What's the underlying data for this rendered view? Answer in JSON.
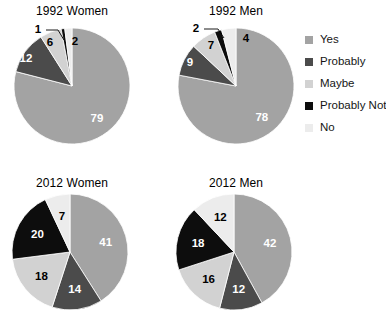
{
  "legend": {
    "position": "right",
    "items": [
      {
        "label": "Yes",
        "color": "#a3a3a3"
      },
      {
        "label": "Probably",
        "color": "#4b4b4b"
      },
      {
        "label": "Maybe",
        "color": "#d2d2d2"
      },
      {
        "label": "Probably Not",
        "color": "#0d0d0d"
      },
      {
        "label": "No",
        "color": "#ececec"
      }
    ]
  },
  "chart_data": [
    {
      "type": "pie",
      "title": "1992 Women",
      "categories": [
        "Yes",
        "Probably",
        "Maybe",
        "Probably Not",
        "No"
      ],
      "values": [
        79,
        12,
        6,
        1,
        2
      ],
      "colors": [
        "#a3a3a3",
        "#4b4b4b",
        "#d2d2d2",
        "#0d0d0d",
        "#ececec"
      ],
      "labels": [
        "79",
        "12",
        "6",
        "1",
        "2"
      ],
      "start_angle": 0,
      "direction": "clockwise"
    },
    {
      "type": "pie",
      "title": "1992 Men",
      "categories": [
        "Yes",
        "Probably",
        "Maybe",
        "Probably Not",
        "No"
      ],
      "values": [
        78,
        9,
        7,
        2,
        4
      ],
      "colors": [
        "#a3a3a3",
        "#4b4b4b",
        "#d2d2d2",
        "#0d0d0d",
        "#ececec"
      ],
      "labels": [
        "78",
        "9",
        "7",
        "2",
        "4"
      ],
      "start_angle": 0,
      "direction": "clockwise"
    },
    {
      "type": "pie",
      "title": "2012 Women",
      "categories": [
        "Yes",
        "Probably",
        "Maybe",
        "Probably Not",
        "No"
      ],
      "values": [
        41,
        14,
        18,
        20,
        7
      ],
      "colors": [
        "#a3a3a3",
        "#4b4b4b",
        "#d2d2d2",
        "#0d0d0d",
        "#ececec"
      ],
      "labels": [
        "41",
        "14",
        "18",
        "20",
        "7"
      ],
      "start_angle": 0,
      "direction": "clockwise"
    },
    {
      "type": "pie",
      "title": "2012 Men",
      "categories": [
        "Yes",
        "Probably",
        "Maybe",
        "Probably Not",
        "No"
      ],
      "values": [
        42,
        12,
        16,
        18,
        12
      ],
      "colors": [
        "#a3a3a3",
        "#4b4b4b",
        "#d2d2d2",
        "#0d0d0d",
        "#ececec"
      ],
      "labels": [
        "42",
        "12",
        "16",
        "18",
        "12"
      ],
      "start_angle": 0,
      "direction": "clockwise"
    }
  ]
}
